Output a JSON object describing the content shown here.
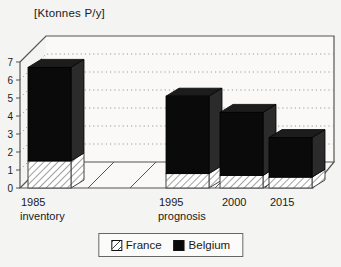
{
  "chart_data": {
    "type": "bar",
    "stacked": true,
    "projection": "3d",
    "title": "",
    "ylabel": "[Ktonnes P/y]",
    "xlabel": "",
    "categories": [
      {
        "line1": "1985",
        "line2": "inventory"
      },
      {
        "line1": "1995",
        "line2": "prognosis"
      },
      {
        "line1": "2000",
        "line2": ""
      },
      {
        "line1": "2015",
        "line2": ""
      }
    ],
    "series": [
      {
        "name": "France",
        "style": "hatched-white",
        "values": [
          1.5,
          0.8,
          0.7,
          0.6
        ]
      },
      {
        "name": "Belgium",
        "style": "solid-black",
        "values": [
          5.2,
          4.3,
          3.5,
          2.2
        ]
      }
    ],
    "totals": [
      6.7,
      5.1,
      4.2,
      2.8
    ],
    "yticks": [
      0,
      1,
      2,
      3,
      4,
      5,
      6,
      7
    ],
    "ylim": [
      0,
      7
    ],
    "grid": "dotted-horizontal",
    "legend_position": "bottom-center"
  },
  "legend": {
    "items": [
      {
        "label": "France",
        "swatch": "hatched"
      },
      {
        "label": "Belgium",
        "swatch": "black"
      }
    ]
  },
  "colors": {
    "background": "#f4f4f2",
    "wall_fill": "#faf9f7",
    "frame_line": "#555555",
    "grid_dot": "#9a9a9a",
    "hatch_line": "#444444",
    "bar_front": "#0a0a0a",
    "bar_top": "#1c1c1c",
    "bar_side": "#2b2b2b",
    "text": "#1a1a1a"
  }
}
